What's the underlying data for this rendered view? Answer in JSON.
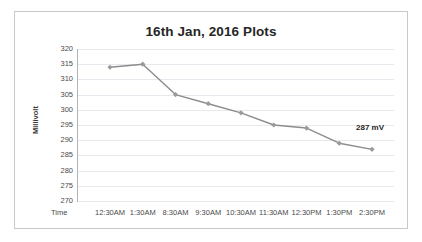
{
  "chart_data": {
    "type": "line",
    "title": "16th Jan, 2016 Plots",
    "xlabel": "Time",
    "ylabel": "Millivolt",
    "categories": [
      "12:30AM",
      "1:30AM",
      "8:30AM",
      "9:30AM",
      "10:30AM",
      "11:30AM",
      "12:30PM",
      "1:30PM",
      "2:30PM"
    ],
    "values": [
      314,
      315,
      305,
      302,
      299,
      295,
      294,
      289,
      287
    ],
    "ylim": [
      270,
      320
    ],
    "ytick_step": 5,
    "yticks": [
      320,
      315,
      310,
      305,
      300,
      295,
      290,
      285,
      280,
      275,
      270
    ],
    "grid": true,
    "legend": "none",
    "annotations": [
      {
        "text": "287 mV",
        "x_category": "2:30PM",
        "value": 287
      }
    ],
    "series_color": "#8c8c8c",
    "marker_color": "#9a9a9a",
    "grid_color": "#e6e9ee",
    "axis_color": "#b4b4b4",
    "title_color": "#262626",
    "frame_color": "#c9c9c9"
  }
}
